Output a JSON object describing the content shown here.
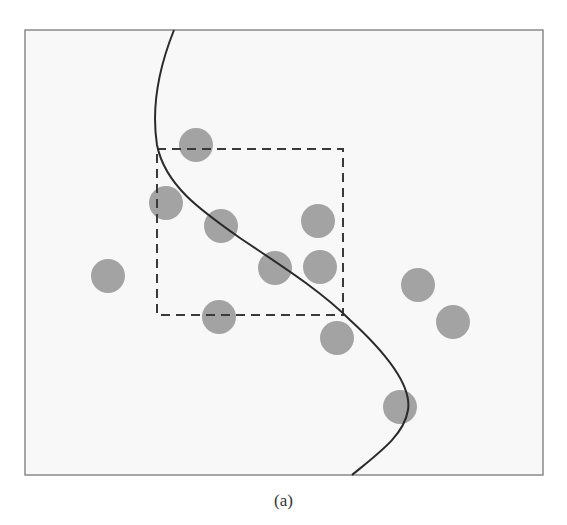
{
  "figure": {
    "caption": "(a)",
    "frame": {
      "x": 25,
      "y": 30,
      "width": 518,
      "height": 445,
      "fill": "#f8f8f8",
      "stroke": "#8a8a8a"
    },
    "dashed_box": {
      "x": 157,
      "y": 149,
      "width": 186,
      "height": 166,
      "stroke": "#3a3a3a"
    },
    "points": {
      "radius": 17,
      "fill": "#a3a3a3",
      "items": [
        {
          "cx": 196,
          "cy": 145
        },
        {
          "cx": 166,
          "cy": 203
        },
        {
          "cx": 221,
          "cy": 226
        },
        {
          "cx": 318,
          "cy": 221
        },
        {
          "cx": 275,
          "cy": 268
        },
        {
          "cx": 320,
          "cy": 267
        },
        {
          "cx": 108,
          "cy": 276
        },
        {
          "cx": 418,
          "cy": 285
        },
        {
          "cx": 453,
          "cy": 322
        },
        {
          "cx": 219,
          "cy": 317
        },
        {
          "cx": 337,
          "cy": 338
        },
        {
          "cx": 400,
          "cy": 407
        }
      ]
    },
    "decision_curve": {
      "stroke": "#2a2a2a",
      "path": "M174,30 C162,60 150,100 157,145 C165,185 200,210 240,238 C280,265 320,290 350,320 C385,352 412,385 408,410 C404,435 380,452 352,475"
    }
  }
}
